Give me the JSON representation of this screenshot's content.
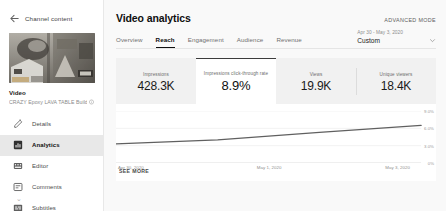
{
  "sidebar": {
    "back": {
      "label": "Channel content",
      "icon": "arrow-left-icon"
    },
    "video": {
      "kicker": "Video",
      "title": "CRAZY Epoxy LAVA TABLE Build",
      "title_icon": "info-icon"
    },
    "menu": [
      {
        "label": "Details",
        "icon": "pencil-icon",
        "active": false
      },
      {
        "label": "Analytics",
        "icon": "analytics-icon",
        "active": true
      },
      {
        "label": "Editor",
        "icon": "editor-icon",
        "active": false
      },
      {
        "label": "Comments",
        "icon": "comment-icon",
        "active": false
      },
      {
        "label": "Subtitles",
        "icon": "subtitles-icon",
        "active": false
      }
    ],
    "more_dot": "⌄"
  },
  "header": {
    "title": "Video analytics",
    "advanced_mode": "ADVANCED MODE"
  },
  "tabs": [
    {
      "label": "Overview",
      "active": false
    },
    {
      "label": "Reach",
      "active": true
    },
    {
      "label": "Engagement",
      "active": false
    },
    {
      "label": "Audience",
      "active": false
    },
    {
      "label": "Revenue",
      "active": false
    }
  ],
  "date_range": {
    "range": "Apr 30 - May 3, 2020",
    "label": "Custom",
    "caret_icon": "chevron-down-icon"
  },
  "cards": [
    {
      "label": "Impressions",
      "value": "428.3K",
      "active": false
    },
    {
      "label": "Impressions click-through rate",
      "value": "8.9%",
      "active": true
    },
    {
      "label": "Views",
      "value": "19.9K",
      "active": false
    },
    {
      "label": "Unique viewers",
      "value": "18.4K",
      "active": false
    }
  ],
  "see_more": "SEE MORE",
  "colors": {
    "page_bg": "#f9f9f9",
    "panel_bg": "#ffffff",
    "card_bg": "#f1f1f1",
    "line": "#606060",
    "active_underline": "#0f0f0f"
  },
  "chart_data": {
    "type": "line",
    "title": "Impressions click-through rate",
    "xlabel": "",
    "ylabel": "",
    "grid": true,
    "legend": false,
    "ylim": [
      0,
      9.0
    ],
    "yticks": [
      "9.0%",
      "6.0%",
      "3.0%",
      "0%"
    ],
    "ytick_values": [
      9.0,
      6.0,
      3.0,
      0
    ],
    "xticks": [
      "Apr 30, 2020",
      "May 1, 2020",
      "May 3, 2020"
    ],
    "x": [
      "Apr 30, 2020",
      "May 1, 2020",
      "May 2, 2020",
      "May 3, 2020"
    ],
    "series": [
      {
        "name": "Impressions click-through rate",
        "values": [
          3.3,
          4.0,
          5.3,
          6.5
        ]
      }
    ]
  }
}
